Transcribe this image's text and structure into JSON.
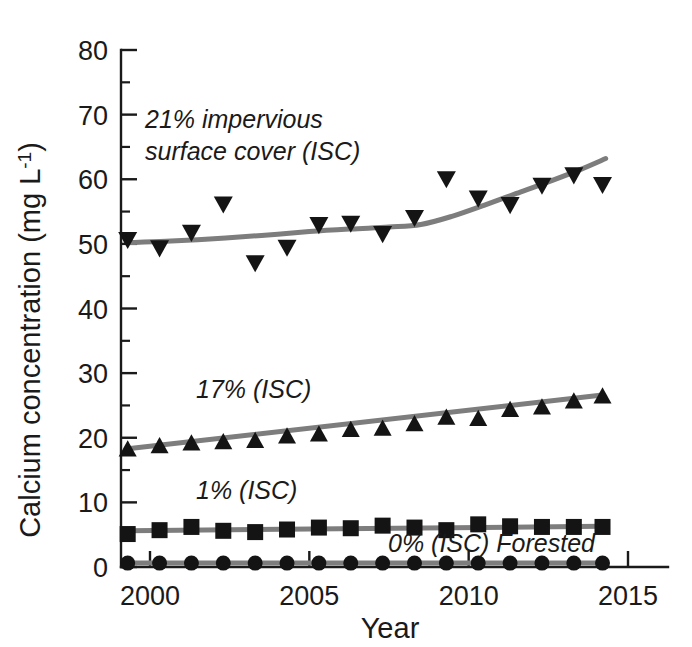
{
  "figure": {
    "background_color": "#ffffff",
    "marker_color": "#141414",
    "trend_color": "#7d7d7d",
    "axis_color": "#1a1a1a"
  },
  "axes": {
    "y_title_main": "Calcium concentration (mg L",
    "y_title_sup": "-1",
    "y_title_close": ")",
    "x_title": "Year",
    "y_ticks": [
      "0",
      "10",
      "20",
      "30",
      "40",
      "50",
      "60",
      "70",
      "80"
    ],
    "x_ticks": [
      "2000",
      "2005",
      "2010",
      "2015"
    ]
  },
  "annotations": {
    "isc21_line1": "21% impervious",
    "isc21_line2": "surface cover (ISC)",
    "isc17": "17% (ISC)",
    "isc1": "1% (ISC)",
    "isc0": "0% (ISC) Forested"
  },
  "chart_data": {
    "type": "scatter",
    "title": "",
    "xlabel": "Year",
    "ylabel": "Calcium concentration (mg L-1)",
    "xlim": [
      1999.1,
      2015.5
    ],
    "ylim": [
      0,
      80
    ],
    "xticks": [
      2000,
      2005,
      2010,
      2015
    ],
    "yticks": [
      0,
      10,
      20,
      30,
      40,
      50,
      60,
      70,
      80
    ],
    "minor_ticks": true,
    "grid": false,
    "legend": "inline-annotations",
    "series": [
      {
        "name": "21% impervious surface cover (ISC)",
        "marker": "triangle-down",
        "label_text": "21% impervious surface cover (ISC)",
        "x": [
          1999.3,
          2000.3,
          2001.3,
          2002.3,
          2003.3,
          2004.3,
          2005.3,
          2006.3,
          2007.3,
          2008.3,
          2009.3,
          2010.3,
          2011.3,
          2012.3,
          2013.3,
          2014.2
        ],
        "y": [
          50.6,
          49.3,
          51.7,
          56.1,
          47.0,
          49.4,
          52.9,
          53.1,
          51.5,
          54.0,
          60.0,
          57.0,
          56.0,
          59.0,
          60.6,
          59.1
        ],
        "trend_x": [
          1999.3,
          2000.5,
          2002.0,
          2003.5,
          2005.0,
          2006.3,
          2007.5,
          2008.5,
          2009.5,
          2010.5,
          2011.5,
          2012.5,
          2013.5,
          2014.3
        ],
        "trend_y": [
          50.2,
          50.4,
          50.8,
          51.3,
          51.9,
          52.3,
          52.6,
          53.0,
          54.3,
          56.0,
          57.8,
          59.6,
          61.5,
          63.2
        ]
      },
      {
        "name": "17% (ISC)",
        "marker": "triangle-up",
        "label_text": "17% (ISC)",
        "x": [
          1999.3,
          2000.3,
          2001.3,
          2002.3,
          2003.3,
          2004.3,
          2005.3,
          2006.3,
          2007.3,
          2008.3,
          2009.3,
          2010.3,
          2011.3,
          2012.3,
          2013.3,
          2014.2
        ],
        "y": [
          18.3,
          18.8,
          19.2,
          19.4,
          19.6,
          20.3,
          20.6,
          21.3,
          21.5,
          22.2,
          23.2,
          23.0,
          24.4,
          24.8,
          25.7,
          26.5
        ],
        "trend_x": [
          1999.3,
          2014.2
        ],
        "trend_y": [
          18.3,
          26.6
        ]
      },
      {
        "name": "1% (ISC)",
        "marker": "square",
        "label_text": "1% (ISC)",
        "x": [
          1999.3,
          2000.3,
          2001.3,
          2002.3,
          2003.3,
          2004.3,
          2005.3,
          2006.3,
          2007.3,
          2008.3,
          2009.3,
          2010.3,
          2011.3,
          2012.3,
          2013.3,
          2014.2
        ],
        "y": [
          5.1,
          5.7,
          6.2,
          5.6,
          5.4,
          5.8,
          6.1,
          6.0,
          6.4,
          6.1,
          5.7,
          6.6,
          6.3,
          6.2,
          6.2,
          6.2
        ],
        "trend_x": [
          1999.3,
          2014.2
        ],
        "trend_y": [
          5.6,
          6.3
        ]
      },
      {
        "name": "0% (ISC) Forested",
        "marker": "circle",
        "label_text": "0% (ISC) Forested",
        "x": [
          1999.3,
          2000.3,
          2001.3,
          2002.3,
          2003.3,
          2004.3,
          2005.3,
          2006.3,
          2007.3,
          2008.3,
          2009.3,
          2010.3,
          2011.3,
          2012.3,
          2013.3,
          2014.2
        ],
        "y": [
          0.6,
          0.6,
          0.6,
          0.6,
          0.6,
          0.6,
          0.6,
          0.6,
          0.6,
          0.6,
          0.6,
          0.6,
          0.6,
          0.6,
          0.6,
          0.6
        ],
        "trend_x": [
          1999.3,
          2014.2
        ],
        "trend_y": [
          0.6,
          0.6
        ]
      }
    ]
  }
}
